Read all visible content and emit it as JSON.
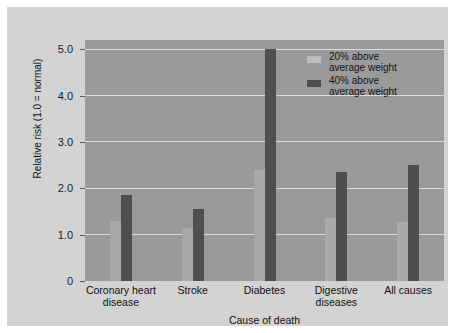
{
  "chart_data": {
    "type": "bar",
    "title": "",
    "xlabel": "Cause of death",
    "ylabel": "Relative risk (1.0 = normal)",
    "categories": [
      "Coronary heart disease",
      "Stroke",
      "Diabetes",
      "Digestive diseases",
      "All causes"
    ],
    "category_lines": [
      [
        "Coronary heart",
        "disease"
      ],
      [
        "Stroke"
      ],
      [
        "Diabetes"
      ],
      [
        "Digestive",
        "diseases"
      ],
      [
        "All causes"
      ]
    ],
    "series": [
      {
        "name": "20% above average weight",
        "color": "#a9a9a9",
        "values": [
          1.3,
          1.15,
          2.4,
          1.35,
          1.27
        ]
      },
      {
        "name": "40% above average weight",
        "color": "#4f4f4f",
        "values": [
          1.85,
          1.55,
          5.0,
          2.35,
          2.5
        ]
      }
    ],
    "ylim": [
      0,
      5.2
    ],
    "yticks": [
      0,
      1.0,
      2.0,
      3.0,
      4.0,
      5.0
    ],
    "ytick_labels": [
      "0",
      "1.0",
      "2.0",
      "3.0",
      "4.0",
      "5.0"
    ],
    "grid": true,
    "legend_position": "top-right",
    "legend_entries": [
      {
        "line1": "20% above",
        "line2": "average weight",
        "color": "#bdbdbd"
      },
      {
        "line1": "40% above",
        "line2": "average weight",
        "color": "#4f4f4f"
      }
    ],
    "colors": {
      "plot_background": "#9a9a9a",
      "card_background": "#d3d3d3",
      "gridline": "#dcdcdc",
      "page_background": "#ffffff"
    }
  }
}
